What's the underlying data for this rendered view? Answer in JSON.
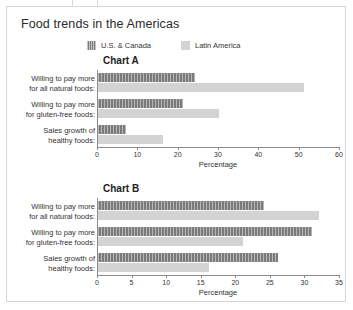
{
  "page": {
    "title": "Food trends in the Americas"
  },
  "legend": {
    "items": [
      {
        "label": "U.S. & Canada",
        "swatch": "legend-swatch-dark",
        "color": "#7b7b7b"
      },
      {
        "label": "Latin America",
        "swatch": "legend-swatch-light",
        "color": "#d3d3d3"
      }
    ]
  },
  "categories": [
    {
      "line1": "Willing to pay more",
      "line2": "for all natural foods:"
    },
    {
      "line1": "Willing to pay more",
      "line2": "for gluten-free foods:"
    },
    {
      "line1": "Sales growth of",
      "line2": "healthy foods:"
    }
  ],
  "charts": [
    {
      "title": "Chart A",
      "xlabel": "Percentage",
      "ticks": [
        "0",
        "10",
        "20",
        "30",
        "40",
        "50",
        "60"
      ]
    },
    {
      "title": "Chart B",
      "xlabel": "Percentage",
      "ticks": [
        "0",
        "5",
        "10",
        "15",
        "20",
        "25",
        "30",
        "35"
      ]
    }
  ],
  "chart_data": [
    {
      "type": "bar",
      "orientation": "horizontal",
      "title": "Chart A",
      "xlabel": "Percentage",
      "ylabel": "",
      "xlim": [
        0,
        60
      ],
      "xticks": [
        0,
        10,
        20,
        30,
        40,
        50,
        60
      ],
      "grid": false,
      "legend_position": "top",
      "categories": [
        "Willing to pay more for all natural foods:",
        "Willing to pay more for gluten-free foods:",
        "Sales growth of healthy foods:"
      ],
      "series": [
        {
          "name": "U.S. & Canada",
          "color": "#7b7b7b",
          "values": [
            24,
            21,
            7
          ]
        },
        {
          "name": "Latin America",
          "color": "#d3d3d3",
          "values": [
            51,
            30,
            16
          ]
        }
      ]
    },
    {
      "type": "bar",
      "orientation": "horizontal",
      "title": "Chart B",
      "xlabel": "Percentage",
      "ylabel": "",
      "xlim": [
        0,
        35
      ],
      "xticks": [
        0,
        5,
        10,
        15,
        20,
        25,
        30,
        35
      ],
      "grid": false,
      "legend_position": "top",
      "categories": [
        "Willing to pay more for all natural foods:",
        "Willing to pay more for gluten-free foods:",
        "Sales growth of healthy foods:"
      ],
      "series": [
        {
          "name": "U.S. & Canada",
          "color": "#7b7b7b",
          "values": [
            24,
            31,
            26
          ]
        },
        {
          "name": "Latin America",
          "color": "#d3d3d3",
          "values": [
            32,
            21,
            16
          ]
        }
      ]
    }
  ]
}
